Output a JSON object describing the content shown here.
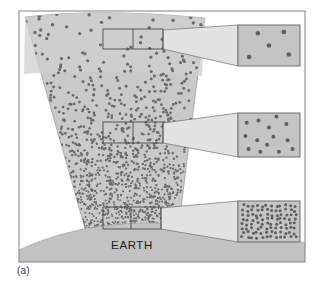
{
  "figure": {
    "caption": "(a)",
    "earth_label": "EARTH",
    "frame": {
      "x": 19,
      "y": 11,
      "width": 286,
      "height": 251,
      "border_color": "#8d8d8d"
    },
    "background": "#ffffff"
  },
  "colors": {
    "cone_fill": "#c9c9c9",
    "cone_fill_upper": "#cfcfcf",
    "cone_stroke": "#9a9a9a",
    "earth_fill": "#c2c2c2",
    "earth_stroke": "#a6a6a6",
    "dot_color": "#6b6b6b",
    "inset_fill": "#c4c4c4",
    "inset_stroke": "#6f6f6f",
    "beam_fill": "#e2e2e2",
    "beam_stroke": "#5d5d5d",
    "source_box_stroke": "#4a4a4a",
    "text_color": "#1d1d1d"
  },
  "chart_data": {
    "type": "scatter",
    "xlabel": "",
    "ylabel": "Altitude",
    "legend": "none",
    "grid": false,
    "samples": [
      {
        "id": "top",
        "level": "high-altitude",
        "relative_density": "sparse",
        "dot_count_in_inset": 5,
        "dot_radius_px": 2.3
      },
      {
        "id": "middle",
        "level": "mid-altitude",
        "relative_density": "moderate",
        "dot_count_in_inset": 14,
        "dot_radius_px": 2.0
      },
      {
        "id": "bottom",
        "level": "low-altitude",
        "relative_density": "dense",
        "dot_count_in_inset": 96,
        "dot_radius_px": 1.5
      }
    ],
    "insets": [
      {
        "id": "inset-top",
        "box": {
          "x": 238,
          "y": 25,
          "width": 62,
          "height": 41
        },
        "points": [
          [
            0.18,
            0.78
          ],
          [
            0.32,
            0.2
          ],
          [
            0.5,
            0.5
          ],
          [
            0.74,
            0.17
          ],
          [
            0.82,
            0.72
          ]
        ]
      },
      {
        "id": "inset-middle",
        "box": {
          "x": 238,
          "y": 113,
          "width": 62,
          "height": 44
        },
        "points": [
          [
            0.14,
            0.22
          ],
          [
            0.12,
            0.52
          ],
          [
            0.17,
            0.82
          ],
          [
            0.33,
            0.17
          ],
          [
            0.31,
            0.62
          ],
          [
            0.36,
            0.88
          ],
          [
            0.5,
            0.33
          ],
          [
            0.47,
            0.72
          ],
          [
            0.57,
            0.54
          ],
          [
            0.62,
            0.08
          ],
          [
            0.66,
            0.88
          ],
          [
            0.78,
            0.25
          ],
          [
            0.8,
            0.62
          ],
          [
            0.88,
            0.82
          ]
        ]
      },
      {
        "id": "inset-bottom",
        "box": {
          "x": 238,
          "y": 201,
          "width": 62,
          "height": 41
        },
        "density": "uniform-dense-grid"
      }
    ],
    "source_boxes": [
      {
        "id": "src-top",
        "x": 103,
        "y": 29,
        "width": 60,
        "height": 20,
        "divider_x": 133
      },
      {
        "id": "src-middle",
        "x": 103,
        "y": 122,
        "width": 60,
        "height": 21,
        "divider_x": 133
      },
      {
        "id": "src-bottom",
        "x": 103,
        "y": 207,
        "width": 58,
        "height": 22,
        "divider_x": 131
      }
    ],
    "cone": {
      "apex_region": "Earth surface",
      "top_width_px": 180,
      "bottom_width_px": 80,
      "note": "Cone widens with altitude; dot density falls off with height."
    }
  }
}
